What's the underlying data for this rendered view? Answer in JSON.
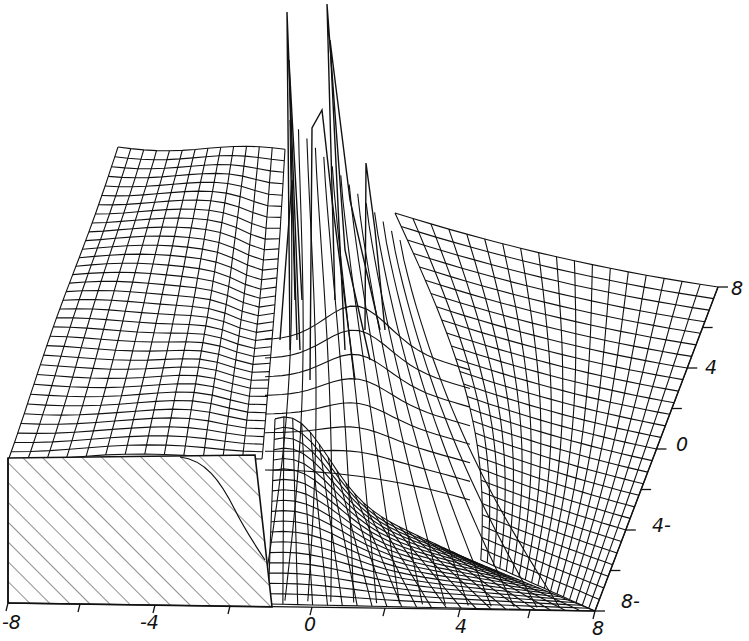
{
  "chart_data": {
    "type": "surface-wireframe-3d",
    "title": "",
    "xlabel": "",
    "ylabel": "",
    "zlabel": "",
    "x_ticks": [
      "-8",
      "-4",
      "0",
      "4",
      "8"
    ],
    "y_ticks": [
      "8",
      "4",
      "0",
      "4-",
      "8-"
    ],
    "x_range": [
      -8,
      8
    ],
    "y_range": [
      -8,
      8
    ],
    "grid": false,
    "legend": null,
    "features": [
      {
        "name": "left-plateau",
        "x": [
          -8,
          -1
        ],
        "relative_height": "high"
      },
      {
        "name": "spike-1",
        "x": -1,
        "y": 8,
        "relative_height": "very high"
      },
      {
        "name": "spike-2",
        "x": 1,
        "y": 8,
        "relative_height": "very high"
      },
      {
        "name": "central-ridge",
        "x": 0.5,
        "relative_height": "medium-high"
      },
      {
        "name": "right-plateau",
        "x": [
          1,
          8
        ],
        "relative_height": "medium"
      },
      {
        "name": "hatched-cutaway-block",
        "x": [
          -8,
          -1
        ],
        "y": [
          -8,
          0
        ]
      }
    ]
  },
  "axes": {
    "x": {
      "labels": [
        {
          "text": "-8",
          "left": 2,
          "top": 613
        },
        {
          "text": "-4",
          "left": 140,
          "top": 613
        },
        {
          "text": "0",
          "left": 304,
          "top": 615
        },
        {
          "text": "4",
          "left": 455,
          "top": 617
        },
        {
          "text": "8",
          "left": 592,
          "top": 619
        }
      ]
    },
    "y": {
      "labels": [
        {
          "text": "8",
          "left": 731,
          "top": 279
        },
        {
          "text": "4",
          "left": 705,
          "top": 358
        },
        {
          "text": "0",
          "left": 676,
          "top": 435
        },
        {
          "text": "4-",
          "left": 652,
          "top": 516
        },
        {
          "text": "8-",
          "left": 621,
          "top": 592
        }
      ]
    }
  }
}
